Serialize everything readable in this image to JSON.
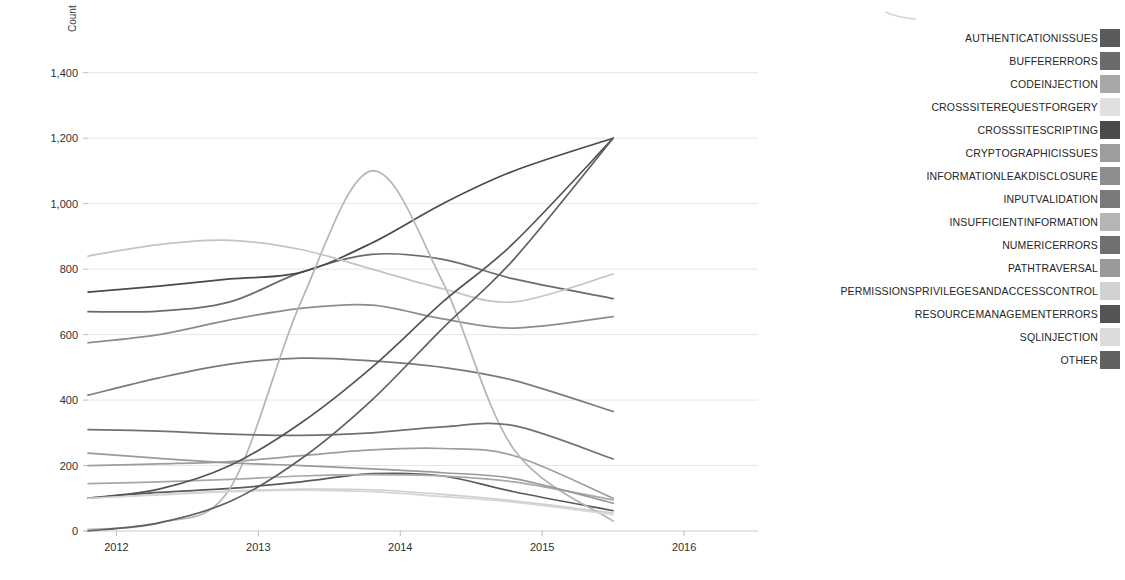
{
  "chart_data": {
    "type": "line",
    "title": "",
    "subtitle": "",
    "xlabel": "",
    "ylabel": "Count",
    "xlim": [
      2011.8,
      2016.45
    ],
    "ylim": [
      0,
      1500
    ],
    "yticks": [
      0,
      200,
      400,
      600,
      800,
      1000,
      1200,
      1400
    ],
    "ytick_labels": [
      "0",
      "200",
      "400",
      "600",
      "800",
      "1,000",
      "1,200",
      "1,400"
    ],
    "xticks": [
      2012,
      2013,
      2014,
      2015,
      2016
    ],
    "xtick_labels": [
      "2012",
      "2013",
      "2014",
      "2015",
      "2016"
    ],
    "grid": true,
    "grid_axis": "y",
    "legend_position": "right",
    "data_x_range": [
      2011.8,
      2015.5
    ],
    "series": [
      {
        "name": "AUTHENTICATIONISSUES",
        "color": "#5a5a5a",
        "x": [
          2011.8,
          2012.3,
          2012.8,
          2013.3,
          2013.8,
          2014.3,
          2014.8,
          2015.5
        ],
        "values": [
          100,
          118,
          130,
          150,
          175,
          168,
          120,
          62
        ]
      },
      {
        "name": "BUFFERERRORS",
        "color": "#6b6b6b",
        "x": [
          2011.8,
          2012.3,
          2012.8,
          2013.3,
          2013.8,
          2014.3,
          2014.8,
          2015.5
        ],
        "values": [
          670,
          672,
          700,
          790,
          845,
          830,
          770,
          710
        ]
      },
      {
        "name": "CODEINJECTION",
        "color": "#a8a8a8",
        "x": [
          2011.8,
          2012.3,
          2012.8,
          2013.3,
          2013.8,
          2014.3,
          2014.8,
          2015.5
        ],
        "values": [
          145,
          150,
          158,
          168,
          172,
          168,
          150,
          95
        ]
      },
      {
        "name": "CROSSSITEREQUESTFORGERY",
        "color": "#cfcfcf",
        "x": [
          2011.8,
          2012.3,
          2012.8,
          2013.3,
          2013.8,
          2014.3,
          2014.8,
          2015.5
        ],
        "values": [
          100,
          112,
          122,
          128,
          126,
          112,
          92,
          55
        ]
      },
      {
        "name": "CROSSSITESCRIPTING",
        "color": "#4a4a4a",
        "x": [
          2011.8,
          2012.3,
          2012.8,
          2013.3,
          2013.8,
          2014.3,
          2014.8,
          2015.5
        ],
        "values": [
          730,
          748,
          770,
          790,
          880,
          1000,
          1100,
          1200
        ]
      },
      {
        "name": "CRYPTOGRAPHICISSUES",
        "color": "#9d9d9d",
        "x": [
          2011.8,
          2012.3,
          2012.8,
          2013.3,
          2013.8,
          2014.3,
          2014.8,
          2015.5
        ],
        "values": [
          200,
          205,
          212,
          230,
          248,
          252,
          230,
          100
        ]
      },
      {
        "name": "INFORMATIONLEAKDISCLOSURE",
        "color": "#8d8d8d",
        "x": [
          2011.8,
          2012.3,
          2012.8,
          2013.3,
          2013.8,
          2014.3,
          2014.8,
          2015.5
        ],
        "values": [
          575,
          600,
          645,
          680,
          690,
          648,
          620,
          655
        ]
      },
      {
        "name": "INPUTVALIDATION",
        "color": "#7a7a7a",
        "x": [
          2011.8,
          2012.3,
          2012.8,
          2013.3,
          2013.8,
          2014.3,
          2014.8,
          2015.5
        ],
        "values": [
          415,
          468,
          510,
          528,
          520,
          500,
          460,
          365
        ]
      },
      {
        "name": "INSUFFICIENTINFORMATION",
        "color": "#b5b5b5",
        "x": [
          2011.8,
          2012.3,
          2012.8,
          2013.3,
          2013.8,
          2014.3,
          2014.8,
          2015.5
        ],
        "values": [
          5,
          25,
          130,
          700,
          1100,
          760,
          250,
          30
        ]
      },
      {
        "name": "NUMERICERRORS",
        "color": "#707070",
        "x": [
          2011.8,
          2012.3,
          2012.8,
          2013.3,
          2013.8,
          2014.3,
          2014.8,
          2015.5
        ],
        "values": [
          310,
          305,
          296,
          292,
          300,
          318,
          322,
          220
        ]
      },
      {
        "name": "PATHTRAVERSAL",
        "color": "#9a9a9a",
        "x": [
          2011.8,
          2012.3,
          2012.8,
          2013.3,
          2013.8,
          2014.3,
          2014.8,
          2015.5
        ],
        "values": [
          238,
          222,
          208,
          200,
          190,
          178,
          160,
          85
        ]
      },
      {
        "name": "PERMISSIONSPRIVILEGESANDACCESSCONTROL",
        "color": "#c4c4c4",
        "x": [
          2011.8,
          2012.3,
          2012.8,
          2013.3,
          2013.8,
          2014.3,
          2014.8,
          2015.5
        ],
        "values": [
          840,
          875,
          888,
          860,
          800,
          740,
          700,
          785
        ]
      },
      {
        "name": "RESOURCEMANAGEMENTERRORS",
        "color": "#545454",
        "x": [
          2011.8,
          2012.3,
          2012.8,
          2013.3,
          2013.8,
          2014.3,
          2014.8,
          2015.5
        ],
        "values": [
          100,
          128,
          200,
          330,
          500,
          700,
          880,
          1200
        ]
      },
      {
        "name": "SQLINJECTION",
        "color": "#d6d6d6",
        "x": [
          2011.8,
          2012.3,
          2012.8,
          2013.3,
          2013.8,
          2014.3,
          2014.8,
          2015.5
        ],
        "values": [
          100,
          110,
          120,
          125,
          120,
          105,
          88,
          50
        ]
      },
      {
        "name": "OTHER",
        "color": "#606060",
        "x": [
          2011.8,
          2012.3,
          2012.8,
          2013.3,
          2013.8,
          2014.3,
          2014.8,
          2015.5
        ],
        "values": [
          0,
          25,
          90,
          220,
          400,
          620,
          830,
          1200
        ]
      }
    ]
  },
  "legend": {
    "items": [
      {
        "label": "AUTHENTICATIONISSUES",
        "color": "#5a5a5a"
      },
      {
        "label": "BUFFERERRORS",
        "color": "#6b6b6b"
      },
      {
        "label": "CODEINJECTION",
        "color": "#a8a8a8"
      },
      {
        "label": "CROSSSITEREQUESTFORGERY",
        "color": "#e0e0e0"
      },
      {
        "label": "CROSSSITESCRIPTING",
        "color": "#4a4a4a"
      },
      {
        "label": "CRYPTOGRAPHICISSUES",
        "color": "#9d9d9d"
      },
      {
        "label": "INFORMATIONLEAKDISCLOSURE",
        "color": "#8d8d8d"
      },
      {
        "label": "INPUTVALIDATION",
        "color": "#7a7a7a"
      },
      {
        "label": "INSUFFICIENTINFORMATION",
        "color": "#b5b5b5"
      },
      {
        "label": "NUMERICERRORS",
        "color": "#707070"
      },
      {
        "label": "PATHTRAVERSAL",
        "color": "#9a9a9a"
      },
      {
        "label": "PERMISSIONSPRIVILEGESANDACCESSCONTROL",
        "color": "#d2d2d2"
      },
      {
        "label": "RESOURCEMANAGEMENTERRORS",
        "color": "#545454"
      },
      {
        "label": "SQLINJECTION",
        "color": "#dcdcdc"
      },
      {
        "label": "OTHER",
        "color": "#606060"
      }
    ]
  }
}
